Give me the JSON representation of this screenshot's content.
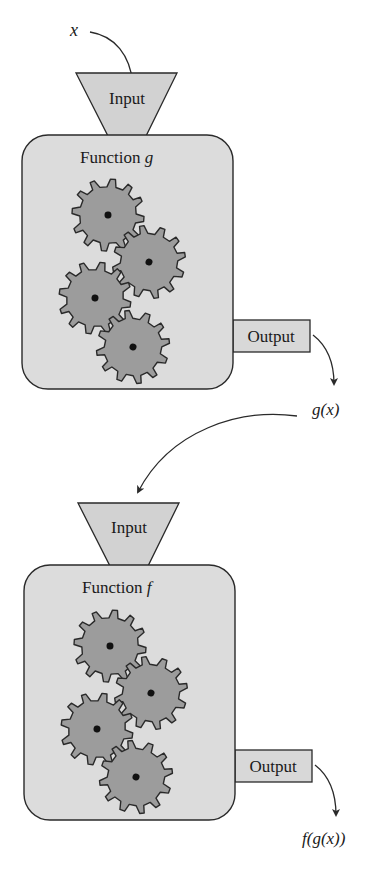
{
  "diagram": {
    "type": "function-composition-machine",
    "colors": {
      "background": "#ffffff",
      "box_fill": "#dcdcdc",
      "funnel_fill": "#d2d2d2",
      "output_fill": "#d8d8d8",
      "gear_fill": "#9c9c9c",
      "stroke": "#2a2a2a"
    },
    "input_var": "x",
    "machines": [
      {
        "id": "g",
        "title_prefix": "Function ",
        "title_var": "g",
        "input_label": "Input",
        "output_label": "Output",
        "result_label": "g(x)"
      },
      {
        "id": "f",
        "title_prefix": "Function ",
        "title_var": "f",
        "input_label": "Input",
        "output_label": "Output",
        "result_label": "f(g(x))"
      }
    ]
  }
}
